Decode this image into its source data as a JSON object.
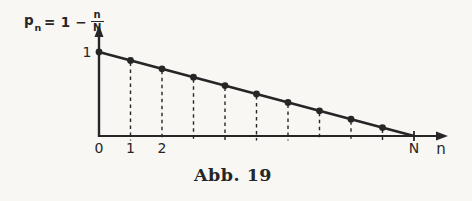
{
  "colors": {
    "ink": "#262626",
    "paper": "#f8f7f4"
  },
  "figure": {
    "caption": "Abb. 19",
    "formula": {
      "var": "p",
      "var_sub": "n",
      "rhs": "= 1 −",
      "frac_num": "n",
      "frac_den": "N"
    }
  },
  "chart_data": {
    "type": "scatter",
    "title": "Abb. 19",
    "xlabel": "n",
    "ylabel": "pₙ = 1 − n/N",
    "x": [
      0,
      1,
      2,
      3,
      4,
      5,
      6,
      7,
      8,
      9
    ],
    "values": [
      1.0,
      0.9,
      0.8,
      0.7,
      0.6,
      0.5,
      0.4,
      0.3,
      0.2,
      0.1
    ],
    "N": 10,
    "x_ticks": [
      {
        "at": 0,
        "label": "0"
      },
      {
        "at": 1,
        "label": "1"
      },
      {
        "at": 2,
        "label": "2"
      },
      {
        "at": 10,
        "label": "N"
      }
    ],
    "y_ticks": [
      {
        "at": 1,
        "label": "1"
      }
    ],
    "xlim": [
      0,
      11
    ],
    "ylim": [
      0,
      1.1
    ],
    "grid": false,
    "legend": "none",
    "drop_lines": "dashed"
  }
}
